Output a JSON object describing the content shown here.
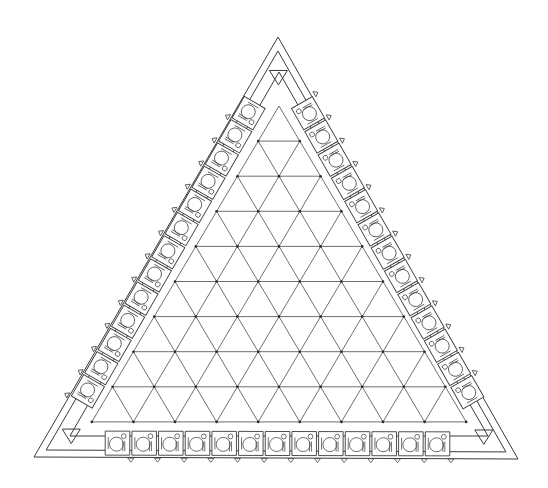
{
  "diagram": {
    "colors": {
      "stroke": "#3a3a3a",
      "background": "#ffffff"
    },
    "outer_triangle": {
      "apex": [
        278,
        37
      ],
      "bottom_left": [
        34,
        457
      ],
      "bottom_right": [
        518,
        459
      ]
    },
    "inner_offset": 7,
    "band_inner_triangle": {
      "apex": [
        279,
        72
      ],
      "bottom_left": [
        70,
        436
      ],
      "bottom_right": [
        488,
        436
      ]
    },
    "grid": {
      "apex": [
        279,
        106
      ],
      "rows": 9,
      "dx": 41.6,
      "dy": 35.1
    },
    "modules_per_side": 13,
    "corner_markers": [
      "triangle-down",
      "triangle-down",
      "triangle-down"
    ],
    "module_icon": "turntable-unit-icon"
  }
}
